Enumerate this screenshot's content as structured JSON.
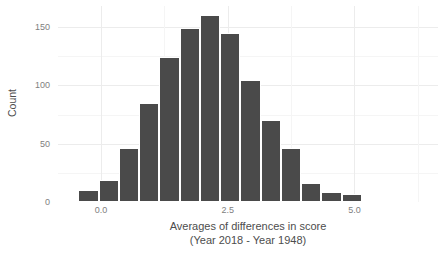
{
  "chart_data": {
    "type": "bar",
    "title": "",
    "subtitle": "",
    "xlabel_line1": "Averages of differences in score",
    "xlabel_line2": "(Year 2018 - Year 1948)",
    "ylabel": "Count",
    "xlim": [
      -0.85,
      6.65
    ],
    "ylim": [
      0,
      168
    ],
    "grid": true,
    "legend": "none",
    "bar_color": "#4a4a4a",
    "bin_width": 0.4,
    "x_ticks": [
      {
        "value": 0.0,
        "label": "0.0"
      },
      {
        "value": 2.5,
        "label": "2.5"
      },
      {
        "value": 5.0,
        "label": "5.0"
      }
    ],
    "x_minor_ticks": [
      -1.25,
      1.25,
      3.75,
      6.25
    ],
    "y_ticks": [
      {
        "value": 0,
        "label": "0"
      },
      {
        "value": 50,
        "label": "50"
      },
      {
        "value": 100,
        "label": "100"
      },
      {
        "value": 150,
        "label": "150"
      }
    ],
    "y_minor_ticks": [
      25,
      75,
      125
    ],
    "bins": [
      {
        "x_center": -0.65,
        "x_low": -0.85,
        "x_high": -0.45,
        "count": 2
      },
      {
        "x_center": -0.25,
        "x_low": -0.45,
        "x_high": -0.05,
        "count": 10
      },
      {
        "x_center": 0.15,
        "x_low": -0.05,
        "x_high": 0.35,
        "count": 19
      },
      {
        "x_center": 0.55,
        "x_low": 0.35,
        "x_high": 0.75,
        "count": 46
      },
      {
        "x_center": 0.95,
        "x_low": 0.75,
        "x_high": 1.15,
        "count": 85
      },
      {
        "x_center": 1.35,
        "x_low": 1.15,
        "x_high": 1.55,
        "count": 124
      },
      {
        "x_center": 1.75,
        "x_low": 1.55,
        "x_high": 1.95,
        "count": 149
      },
      {
        "x_center": 2.15,
        "x_low": 1.95,
        "x_high": 2.35,
        "count": 160
      },
      {
        "x_center": 2.55,
        "x_low": 2.35,
        "x_high": 2.75,
        "count": 145
      },
      {
        "x_center": 2.95,
        "x_low": 2.75,
        "x_high": 3.15,
        "count": 105
      },
      {
        "x_center": 3.35,
        "x_low": 3.15,
        "x_high": 3.55,
        "count": 70
      },
      {
        "x_center": 3.75,
        "x_low": 3.55,
        "x_high": 3.95,
        "count": 46
      },
      {
        "x_center": 4.15,
        "x_low": 3.95,
        "x_high": 4.35,
        "count": 16
      },
      {
        "x_center": 4.55,
        "x_low": 4.35,
        "x_high": 4.75,
        "count": 9
      },
      {
        "x_center": 4.95,
        "x_low": 4.75,
        "x_high": 5.15,
        "count": 7
      },
      {
        "x_center": 5.35,
        "x_low": 5.15,
        "x_high": 5.55,
        "count": 0
      }
    ]
  }
}
